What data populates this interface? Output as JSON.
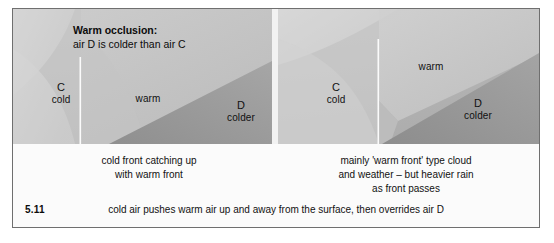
{
  "figure": {
    "number": "5.11",
    "title_strong": "Warm occlusion:",
    "title_sub": "air D is colder than air C",
    "summary": "cold air pushes warm air up and away from the surface, then overrides air D"
  },
  "panels": [
    {
      "id": "left",
      "name": "cold-front-catching-up",
      "labels": {
        "cold_mass_letter": "C",
        "cold_mass_name": "cold",
        "warm_mass_name": "warm",
        "colder_mass_letter": "D",
        "colder_mass_name": "colder"
      },
      "caption": [
        "cold front catching up",
        "with warm front"
      ]
    },
    {
      "id": "right",
      "name": "warm-front-type-weather",
      "labels": {
        "cold_mass_letter": "C",
        "cold_mass_name": "cold",
        "warm_mass_name": "warm",
        "colder_mass_letter": "D",
        "colder_mass_name": "colder"
      },
      "caption": [
        "mainly 'warm front' type cloud",
        "and weather – but heavier rain",
        "as front passes"
      ]
    }
  ],
  "colors": {
    "sky_mid_grey": "#b4b4b4",
    "warm_air_light": "#c9c9c9",
    "cold_air_pale": "#d4d4d4",
    "colder_air_dark": "#9a9a9a",
    "front_line_white": "#fbfbfb",
    "frame_border": "#6f6f6f",
    "caption_background": "#fbfbfb",
    "text": "#111111"
  }
}
